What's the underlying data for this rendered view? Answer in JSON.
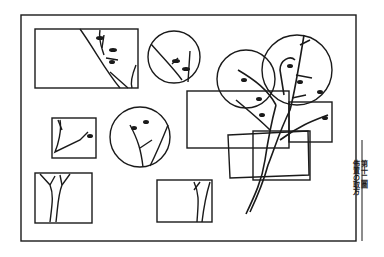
{
  "plate": {
    "figure_label": "第十二圖",
    "figure_title": "佈置の取方",
    "ink_color": "#1a1a1a",
    "paper_color": "#ffffff",
    "outer_frame": {
      "x": 21,
      "y": 15,
      "w": 335,
      "h": 226
    },
    "frames": [
      {
        "shape": "rect",
        "x": 35,
        "y": 29,
        "w": 103,
        "h": 59
      },
      {
        "shape": "circle",
        "cx": 174,
        "cy": 57,
        "r": 26
      },
      {
        "shape": "circle",
        "cx": 246,
        "cy": 79,
        "r": 29
      },
      {
        "shape": "circle",
        "cx": 297,
        "cy": 70,
        "r": 35
      },
      {
        "shape": "rect",
        "x": 187,
        "y": 91,
        "w": 102,
        "h": 57
      },
      {
        "shape": "rect",
        "x": 289,
        "y": 102,
        "w": 43,
        "h": 40
      },
      {
        "shape": "rect",
        "x": 52,
        "y": 118,
        "w": 44,
        "h": 40
      },
      {
        "shape": "circle",
        "cx": 140,
        "cy": 137,
        "r": 30
      },
      {
        "shape": "rect",
        "x": 228,
        "y": 133,
        "w": 80,
        "h": 45
      },
      {
        "shape": "rect",
        "x": 253,
        "y": 131,
        "w": 57,
        "h": 49
      },
      {
        "shape": "rect",
        "x": 35,
        "y": 173,
        "w": 57,
        "h": 50
      },
      {
        "shape": "rect",
        "x": 157,
        "y": 180,
        "w": 55,
        "h": 42
      }
    ]
  }
}
